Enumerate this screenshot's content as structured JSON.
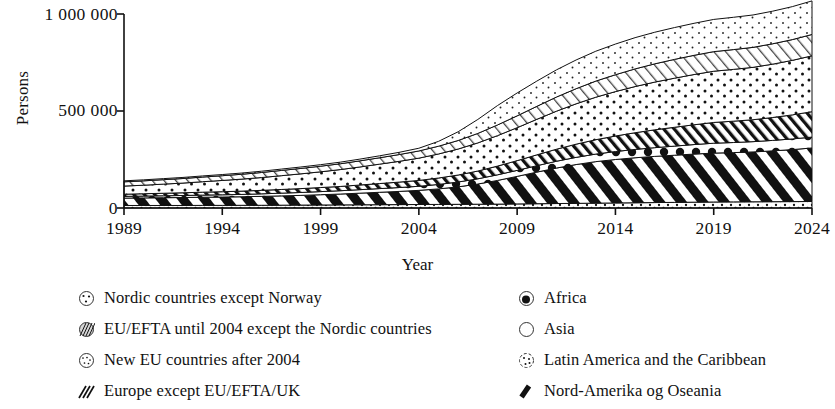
{
  "chart_data": {
    "type": "area",
    "title": "",
    "subtitle": "",
    "xlabel": "Year",
    "ylabel": "Persons",
    "xlim": [
      1989,
      2024
    ],
    "ylim": [
      0,
      1000000
    ],
    "grid": false,
    "legend_position": "bottom",
    "stacked": true,
    "y_ticks": [
      "0",
      "500 000",
      "1 000 000"
    ],
    "y_tick_values": [
      0,
      500000,
      1000000
    ],
    "x_ticks": [
      "1989",
      "1994",
      "1999",
      "2004",
      "2009",
      "2014",
      "2019",
      "2024"
    ],
    "x_tick_values": [
      1989,
      1994,
      1999,
      2004,
      2009,
      2014,
      2019,
      2024
    ],
    "x": [
      1989,
      1990,
      1991,
      1992,
      1993,
      1994,
      1995,
      1996,
      1997,
      1998,
      1999,
      2000,
      2001,
      2002,
      2003,
      2004,
      2005,
      2006,
      2007,
      2008,
      2009,
      2010,
      2011,
      2012,
      2013,
      2014,
      2015,
      2016,
      2017,
      2018,
      2019,
      2020,
      2021,
      2022,
      2023,
      2024
    ],
    "series": [
      {
        "name": "Nordic countries except Norway",
        "pattern": "sparse-dots",
        "values": [
          13000,
          13000,
          13000,
          13000,
          13500,
          13500,
          14000,
          14000,
          14500,
          15000,
          15500,
          16000,
          16500,
          17000,
          17500,
          18000,
          18500,
          19000,
          19500,
          20000,
          21000,
          22000,
          23000,
          24000,
          25000,
          26000,
          27000,
          28000,
          29000,
          30000,
          31000,
          31500,
          32000,
          32500,
          33000,
          33500
        ]
      },
      {
        "name": "Nord-Amerika og Oseania",
        "pattern": "bold-black-diagonal",
        "values": [
          38000,
          39000,
          40000,
          41000,
          42000,
          43000,
          44000,
          46000,
          48000,
          50000,
          53000,
          56000,
          60000,
          64000,
          68000,
          73000,
          80000,
          90000,
          104000,
          122000,
          142000,
          163000,
          183000,
          200000,
          214000,
          224000,
          232000,
          238000,
          243000,
          248000,
          252000,
          254000,
          257000,
          262000,
          268000,
          276000
        ]
      },
      {
        "name": "Africa",
        "pattern": "dots-circles",
        "values": [
          9000,
          9500,
          10000,
          10500,
          11000,
          11500,
          12000,
          13000,
          14000,
          15000,
          16000,
          17000,
          18000,
          19000,
          20000,
          21000,
          23000,
          25000,
          27000,
          29000,
          31000,
          33000,
          35000,
          37000,
          39000,
          41000,
          43000,
          45000,
          47000,
          49000,
          51000,
          52000,
          53000,
          54000,
          55000,
          56000
        ]
      },
      {
        "name": "Europe except EU/EFTA/UK",
        "pattern": "medium-diagonal-hatch",
        "values": [
          11000,
          12000,
          13000,
          14000,
          15000,
          16000,
          17000,
          18000,
          19000,
          20000,
          21000,
          22000,
          24000,
          26000,
          28000,
          30000,
          33000,
          36000,
          40000,
          45000,
          50000,
          56000,
          62000,
          68000,
          74000,
          80000,
          86000,
          92000,
          97000,
          102000,
          107000,
          110000,
          113000,
          118000,
          124000,
          131000
        ]
      },
      {
        "name": "Asia",
        "pattern": "large-dots",
        "values": [
          42000,
          44000,
          47000,
          50000,
          54000,
          58000,
          62000,
          66000,
          71000,
          76000,
          81000,
          87000,
          93000,
          100000,
          107000,
          115000,
          124000,
          134000,
          145000,
          157000,
          170000,
          183000,
          196000,
          208000,
          219000,
          229000,
          238000,
          246000,
          253000,
          259000,
          264000,
          267000,
          270000,
          275000,
          281000,
          288000
        ]
      },
      {
        "name": "EU/EFTA until 2004 except the Nordic countries",
        "pattern": "light-diagonal-hatch",
        "values": [
          22000,
          22500,
          23000,
          23500,
          24000,
          24500,
          25000,
          26000,
          27000,
          28000,
          29000,
          30000,
          31500,
          33000,
          35000,
          37000,
          40000,
          44000,
          49000,
          55000,
          61000,
          67000,
          73000,
          78000,
          83000,
          87000,
          91000,
          94000,
          97000,
          99000,
          101000,
          102000,
          103000,
          105000,
          107000,
          110000
        ]
      },
      {
        "name": "New EU countries after 2004",
        "pattern": "fine-dots",
        "values": [
          5000,
          5200,
          5400,
          5600,
          5800,
          6000,
          6300,
          6600,
          7000,
          7400,
          7800,
          8300,
          9000,
          10000,
          11500,
          14000,
          25000,
          45000,
          72000,
          100000,
          118000,
          130000,
          140000,
          148000,
          154000,
          158000,
          161000,
          163000,
          164000,
          165000,
          166000,
          166500,
          167000,
          168000,
          170000,
          173000
        ]
      }
    ],
    "totals": [
      140000,
      145200,
      151400,
      157600,
      165300,
      172500,
      180300,
      189600,
      200500,
      211400,
      223300,
      236300,
      252000,
      269000,
      287000,
      308000,
      343500,
      393000,
      456500,
      528000,
      593000,
      654000,
      712000,
      763000,
      808000,
      845000,
      878000,
      906000,
      930000,
      952000,
      972000,
      983000,
      995000,
      1014500,
      1038000,
      1068500
    ]
  },
  "axes": {
    "y_title": "Persons",
    "x_title": "Year"
  },
  "legend": {
    "left_column": [
      {
        "label": "Nordic countries except Norway",
        "swatch": "circle-sparse-dots-icon"
      },
      {
        "label": "EU/EFTA until 2004 except the Nordic countries",
        "swatch": "circle-diagonal-hatch-icon"
      },
      {
        "label": "New EU countries after 2004",
        "swatch": "circle-fine-dots-icon"
      },
      {
        "label": "Europe except EU/EFTA/UK",
        "swatch": "diagonal-stripes-icon"
      }
    ],
    "right_column": [
      {
        "label": "Africa",
        "swatch": "circle-filled-dot-icon"
      },
      {
        "label": "Asia",
        "swatch": "circle-open-icon"
      },
      {
        "label": "Latin America and the Caribbean",
        "swatch": "circle-scattered-dots-icon"
      },
      {
        "label": "Nord-Amerika og Oseania",
        "swatch": "bold-black-stripe-icon"
      }
    ]
  },
  "colors": {
    "ink": "#111111",
    "background": "#ffffff",
    "axis": "#1a1a1a"
  }
}
